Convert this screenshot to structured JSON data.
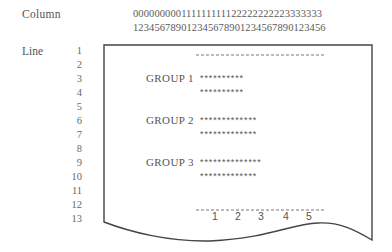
{
  "header": {
    "column_label": "Column",
    "column_digits_row1": "000000000111111111122222222223333333",
    "column_digits_row2": "123456789012345678901234567890123456"
  },
  "line_axis": {
    "label": "Line",
    "numbers": [
      "1",
      "2",
      "3",
      "4",
      "5",
      "6",
      "7",
      "8",
      "9",
      "10",
      "11",
      "12",
      "13"
    ]
  },
  "paper": {
    "top_rule": "- - - - - - - - - - - - - - - - - - - - - - -",
    "groups": [
      {
        "label": "GROUP 1",
        "line": 3,
        "rows": [
          "**********",
          "**********"
        ]
      },
      {
        "label": "GROUP 2",
        "line": 6,
        "rows": [
          "*************",
          "*************"
        ]
      },
      {
        "label": "GROUP 3",
        "line": 9,
        "rows": [
          "**************",
          "*************"
        ]
      }
    ],
    "bottom_scale": [
      "1",
      "2",
      "3",
      "4",
      "5"
    ]
  },
  "colors": {
    "ink": "#555555",
    "border": "#444444",
    "dash": "#777777"
  }
}
